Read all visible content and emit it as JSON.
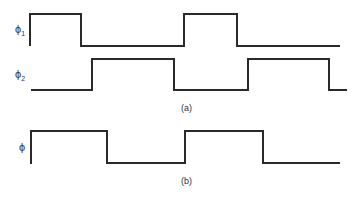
{
  "labels": {
    "phi1": "ϕ",
    "phi1_sub": "1",
    "phi2": "ϕ",
    "phi2_sub": "2",
    "phi": "ϕ"
  },
  "captions": {
    "a": "(a)",
    "b": "(b)"
  },
  "waveforms": {
    "phi1": {
      "high_y": 14,
      "low_y": 46,
      "edges": [
        30,
        81,
        184,
        237
      ],
      "end_x": 340
    },
    "phi2": {
      "high_y": 59,
      "low_y": 90,
      "edges": [
        92,
        174,
        248,
        329
      ],
      "end_x": 347
    },
    "phi": {
      "high_y": 131,
      "low_y": 163,
      "edges": [
        31,
        107,
        185,
        263
      ],
      "end_x": 340
    }
  },
  "colors": {
    "stroke": "#2a2a2a",
    "background": "#ffffff"
  }
}
